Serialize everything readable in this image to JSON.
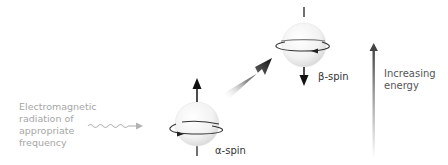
{
  "radiation": {
    "lines": [
      "Electromagnetic",
      "radiation of",
      "appropriate",
      "frequency"
    ]
  },
  "alpha": {
    "label": "α-spin"
  },
  "beta": {
    "label": "β-spin"
  },
  "energy": {
    "lines": [
      "Increasing",
      "energy"
    ]
  },
  "colors": {
    "radiation_text": "#a6a6a6",
    "wave": "#b3b3b3",
    "sphere_edge": "#e6e6e6",
    "arrow": "#1a1a1a",
    "ring": "#333333"
  }
}
